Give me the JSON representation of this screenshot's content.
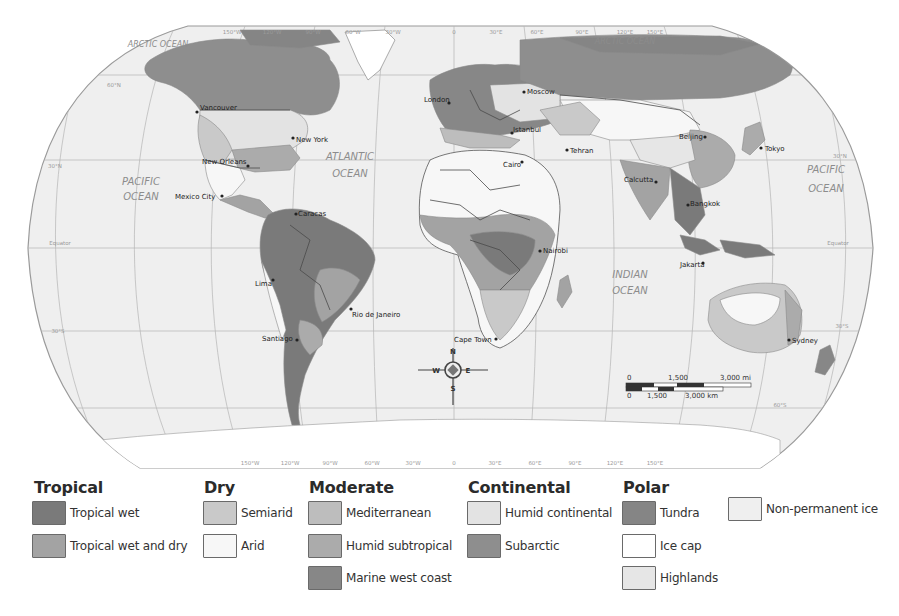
{
  "map": {
    "projection": "Robinson",
    "oceans": [
      {
        "label_line1": "ARCTIC OCEAN",
        "x": 158,
        "y": 45
      },
      {
        "label_line1": "ARCTIC OCEAN",
        "x": 625,
        "y": 42
      },
      {
        "label_line1": "PACIFIC",
        "label_line2": "OCEAN",
        "x": 141,
        "y": 185
      },
      {
        "label_line1": "ATLANTIC",
        "label_line2": "OCEAN",
        "x": 350,
        "y": 160
      },
      {
        "label_line1": "INDIAN",
        "label_line2": "OCEAN",
        "x": 630,
        "y": 278
      },
      {
        "label_line1": "PACIFIC",
        "label_line2": "OCEAN",
        "x": 826,
        "y": 173
      }
    ],
    "cities": [
      {
        "name": "Vancouver",
        "x": 197,
        "y": 109
      },
      {
        "name": "New York",
        "x": 293,
        "y": 138
      },
      {
        "name": "New Orleans",
        "x": 248,
        "y": 166
      },
      {
        "name": "Mexico City",
        "x": 222,
        "y": 196
      },
      {
        "name": "Caracas",
        "x": 296,
        "y": 214
      },
      {
        "name": "Lima",
        "x": 273,
        "y": 280
      },
      {
        "name": "Rio de Janeiro",
        "x": 351,
        "y": 309
      },
      {
        "name": "Santiago",
        "x": 297,
        "y": 340
      },
      {
        "name": "London",
        "x": 449,
        "y": 103
      },
      {
        "name": "Moscow",
        "x": 524,
        "y": 92
      },
      {
        "name": "Istanbul",
        "x": 512,
        "y": 133
      },
      {
        "name": "Cairo",
        "x": 522,
        "y": 162
      },
      {
        "name": "Tehran",
        "x": 567,
        "y": 150
      },
      {
        "name": "Beijing",
        "x": 705,
        "y": 137
      },
      {
        "name": "Tokyo",
        "x": 761,
        "y": 148
      },
      {
        "name": "Calcutta",
        "x": 656,
        "y": 182
      },
      {
        "name": "Bangkok",
        "x": 688,
        "y": 205
      },
      {
        "name": "Nairobi",
        "x": 540,
        "y": 251
      },
      {
        "name": "Jakarta",
        "x": 703,
        "y": 263
      },
      {
        "name": "Cape Town",
        "x": 496,
        "y": 339
      },
      {
        "name": "Sydney",
        "x": 789,
        "y": 340
      }
    ],
    "graticule_labels": {
      "top": [
        "150°W",
        "120°W",
        "90°W",
        "60°W",
        "30°W",
        "0",
        "30°E",
        "60°E",
        "90°E",
        "120°E",
        "150°E"
      ],
      "bottom": [
        "150°W",
        "120°W",
        "90°W",
        "60°W",
        "30°W",
        "0",
        "30°E",
        "60°E",
        "90°E",
        "120°E",
        "150°E"
      ],
      "left": [
        "60°N",
        "30°N",
        "Equator",
        "30°S"
      ],
      "right": [
        "30°N",
        "Equator",
        "30°S",
        "60°S"
      ]
    },
    "compass": {
      "n": "N",
      "s": "S",
      "e": "E",
      "w": "W"
    },
    "scale_bar": {
      "miles": [
        "0",
        "1,500",
        "3,000 mi"
      ],
      "km": [
        "0",
        "1,500",
        "3,000 km"
      ]
    }
  },
  "legend": {
    "groups": [
      {
        "title": "Tropical",
        "items": [
          {
            "label": "Tropical wet",
            "color": "#7a7a7a"
          },
          {
            "label": "Tropical wet and dry",
            "color": "#a3a3a3"
          }
        ]
      },
      {
        "title": "Dry",
        "items": [
          {
            "label": "Semiarid",
            "color": "#c9c9c9"
          },
          {
            "label": "Arid",
            "color": "#f7f7f7"
          }
        ]
      },
      {
        "title": "Moderate",
        "items": [
          {
            "label": "Mediterranean",
            "color": "#bdbdbd"
          },
          {
            "label": "Humid subtropical",
            "color": "#ababab"
          },
          {
            "label": "Marine west coast",
            "color": "#878787"
          }
        ]
      },
      {
        "title": "Continental",
        "items": [
          {
            "label": "Humid continental",
            "color": "#e3e3e3"
          },
          {
            "label": "Subarctic",
            "color": "#8e8e8e"
          }
        ]
      },
      {
        "title": "Polar",
        "items": [
          {
            "label": "Tundra",
            "color": "#858585"
          },
          {
            "label": "Ice cap",
            "color": "#ffffff"
          },
          {
            "label": "Highlands",
            "color": "#e6e6e6"
          }
        ]
      },
      {
        "title": "",
        "items": [
          {
            "label": "Non-permanent ice",
            "color": "#efefef"
          }
        ]
      }
    ]
  },
  "colors": {
    "ocean": "#eeeeee",
    "land_default": "#d4d4d4",
    "border": "#4a4a4a",
    "outline": "#9a9a9a",
    "text": "#333333"
  }
}
